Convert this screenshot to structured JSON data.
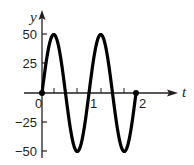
{
  "chart_data": {
    "type": "line",
    "title": "",
    "xlabel": "t",
    "ylabel": "y",
    "xlim": [
      0,
      2
    ],
    "ylim": [
      -50,
      50
    ],
    "grid": false,
    "legend": null,
    "equation_shape": "y = 50 sin(2πt)",
    "x_ticks": [
      0,
      0.25,
      0.5,
      0.75,
      1,
      1.25,
      1.5,
      1.75,
      2
    ],
    "x_tick_labels": [
      {
        "value": 0,
        "label": "0"
      },
      {
        "value": 1,
        "label": "1"
      },
      {
        "value": 2,
        "label": "2"
      }
    ],
    "y_ticks": [
      50,
      25,
      0,
      -25,
      -50
    ],
    "y_tick_labels": [
      "50",
      "25",
      "0",
      "−25",
      "−50"
    ],
    "series": [
      {
        "name": "y(t)",
        "x": [
          0,
          0.25,
          0.5,
          0.75,
          1,
          1.25,
          1.5,
          1.75,
          2
        ],
        "values": [
          0,
          50,
          0,
          -50,
          0,
          50,
          0,
          -50,
          0
        ],
        "endpoints": "closed dots at t=0 and t=2"
      }
    ],
    "colors": {
      "curve": "#000000",
      "axes": "#231f20"
    }
  },
  "labels": {
    "y_axis": "y",
    "t_axis": "t",
    "y50": "50",
    "y25": "25",
    "yneg25": "−25",
    "yneg50": "−50",
    "x0": "0",
    "x1": "1",
    "x2": "2"
  }
}
